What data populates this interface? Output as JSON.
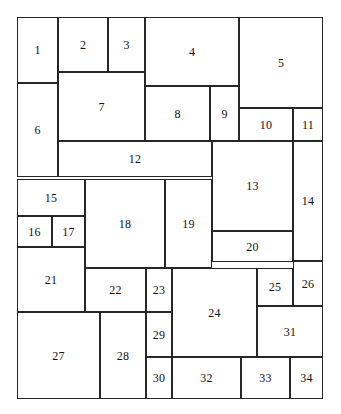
{
  "diagram": {
    "type": "rectangle-dissection",
    "canvas": {
      "width": 341,
      "height": 414
    },
    "bounds": {
      "x": 17,
      "y": 17,
      "width": 306,
      "height": 382
    },
    "style": {
      "stroke_color": "#272727",
      "fill_color": "#ffffff",
      "background_color": "#ffffff",
      "stroke_width": 1,
      "label_color": "#111111",
      "label_font_size": 12
    },
    "cell_count": 34,
    "cells": [
      {
        "label": "1",
        "x": 17,
        "y": 17,
        "w": 41,
        "h": 66
      },
      {
        "label": "2",
        "x": 58,
        "y": 17,
        "w": 50,
        "h": 55
      },
      {
        "label": "3",
        "x": 108,
        "y": 17,
        "w": 37,
        "h": 55
      },
      {
        "label": "4",
        "x": 145,
        "y": 17,
        "w": 94,
        "h": 69
      },
      {
        "label": "5",
        "x": 239,
        "y": 17,
        "w": 84,
        "h": 91
      },
      {
        "label": "6",
        "x": 17,
        "y": 83,
        "w": 41,
        "h": 94
      },
      {
        "label": "7",
        "x": 58,
        "y": 72,
        "w": 87,
        "h": 69
      },
      {
        "label": "8",
        "x": 145,
        "y": 86,
        "w": 65,
        "h": 55
      },
      {
        "label": "9",
        "x": 210,
        "y": 86,
        "w": 29,
        "h": 55
      },
      {
        "label": "10",
        "x": 239,
        "y": 108,
        "w": 54,
        "h": 33
      },
      {
        "label": "11",
        "x": 293,
        "y": 108,
        "w": 30,
        "h": 33
      },
      {
        "label": "12",
        "x": 58,
        "y": 141,
        "w": 154,
        "h": 36
      },
      {
        "label": "13",
        "x": 212,
        "y": 141,
        "w": 81,
        "h": 90
      },
      {
        "label": "14",
        "x": 293,
        "y": 141,
        "w": 30,
        "h": 120
      },
      {
        "label": "15",
        "x": 17,
        "y": 179,
        "w": 68,
        "h": 37
      },
      {
        "label": "16",
        "x": 17,
        "y": 216,
        "w": 35,
        "h": 31
      },
      {
        "label": "17",
        "x": 52,
        "y": 216,
        "w": 33,
        "h": 31
      },
      {
        "label": "18",
        "x": 85,
        "y": 179,
        "w": 80,
        "h": 89
      },
      {
        "label": "19",
        "x": 165,
        "y": 179,
        "w": 47,
        "h": 89
      },
      {
        "label": "20",
        "x": 212,
        "y": 231,
        "w": 81,
        "h": 31
      },
      {
        "label": "21",
        "x": 17,
        "y": 247,
        "w": 68,
        "h": 65
      },
      {
        "label": "22",
        "x": 85,
        "y": 268,
        "w": 61,
        "h": 44
      },
      {
        "label": "23",
        "x": 146,
        "y": 268,
        "w": 26,
        "h": 44
      },
      {
        "label": "24",
        "x": 172,
        "y": 268,
        "w": 85,
        "h": 89
      },
      {
        "label": "25",
        "x": 257,
        "y": 268,
        "w": 36,
        "h": 38
      },
      {
        "label": "26",
        "x": 293,
        "y": 261,
        "w": 30,
        "h": 45
      },
      {
        "label": "27",
        "x": 17,
        "y": 312,
        "w": 83,
        "h": 87
      },
      {
        "label": "28",
        "x": 100,
        "y": 312,
        "w": 46,
        "h": 87
      },
      {
        "label": "29",
        "x": 146,
        "y": 312,
        "w": 26,
        "h": 45
      },
      {
        "label": "30",
        "x": 146,
        "y": 357,
        "w": 26,
        "h": 42
      },
      {
        "label": "31",
        "x": 257,
        "y": 306,
        "w": 66,
        "h": 51
      },
      {
        "label": "32",
        "x": 172,
        "y": 357,
        "w": 69,
        "h": 42
      },
      {
        "label": "33",
        "x": 241,
        "y": 357,
        "w": 49,
        "h": 42
      },
      {
        "label": "34",
        "x": 290,
        "y": 357,
        "w": 33,
        "h": 42
      }
    ]
  }
}
